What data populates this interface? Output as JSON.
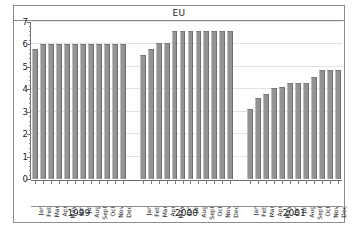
{
  "chart_data": {
    "type": "bar",
    "title": "EU",
    "xlabel": "",
    "ylabel": "",
    "ylim": [
      0,
      7
    ],
    "ytick_labels": [
      "0",
      "1",
      "2",
      "3",
      "4",
      "5",
      "6",
      "7"
    ],
    "ytick_values": [
      0,
      1,
      2,
      3,
      4,
      5,
      6,
      7
    ],
    "grid": true,
    "legend": "none",
    "group_labels": [
      "1999",
      "2000",
      "2001"
    ],
    "categories": [
      "Jan",
      "Feb",
      "Mar",
      "Apr",
      "May",
      "Jun",
      "Jul",
      "Aug",
      "Sept",
      "Oct",
      "Nov",
      "Dec",
      "Jan",
      "Feb",
      "Mar",
      "Apr",
      "May",
      "Jun",
      "Jul",
      "Aug",
      "Sept",
      "Oct",
      "Nov",
      "Dec",
      "Jan",
      "Feb",
      "Mar",
      "Apr",
      "May",
      "Jun",
      "Jul",
      "Aug",
      "Sept",
      "Oct",
      "Nov",
      "Dec"
    ],
    "values": [
      5.8,
      6.0,
      6.0,
      6.0,
      6.0,
      6.0,
      6.0,
      6.0,
      6.0,
      6.0,
      6.0,
      6.0,
      5.55,
      5.8,
      6.05,
      6.05,
      6.6,
      6.6,
      6.6,
      6.6,
      6.6,
      6.6,
      6.6,
      6.6,
      3.1,
      3.6,
      3.8,
      4.05,
      4.1,
      4.3,
      4.3,
      4.3,
      4.55,
      4.85,
      4.85,
      4.85
    ],
    "groups": [
      {
        "year": "1999",
        "months": [
          "Jan",
          "Feb",
          "Mar",
          "Apr",
          "May",
          "Jun",
          "Jul",
          "Aug",
          "Sept",
          "Oct",
          "Nov",
          "Dec"
        ],
        "values": [
          5.8,
          6.0,
          6.0,
          6.0,
          6.0,
          6.0,
          6.0,
          6.0,
          6.0,
          6.0,
          6.0,
          6.0
        ]
      },
      {
        "year": "2000",
        "months": [
          "Jan",
          "Feb",
          "Mar",
          "Apr",
          "May",
          "Jun",
          "Jul",
          "Aug",
          "Sept",
          "Oct",
          "Nov",
          "Dec"
        ],
        "values": [
          5.55,
          5.8,
          6.05,
          6.05,
          6.6,
          6.6,
          6.6,
          6.6,
          6.6,
          6.6,
          6.6,
          6.6
        ]
      },
      {
        "year": "2001",
        "months": [
          "Jan",
          "Feb",
          "Mar",
          "Apr",
          "May",
          "Jun",
          "Jul",
          "Aug",
          "Sept",
          "Oct",
          "Nov",
          "Dec"
        ],
        "values": [
          3.1,
          3.6,
          3.8,
          4.05,
          4.1,
          4.3,
          4.3,
          4.3,
          4.55,
          4.85,
          4.85,
          4.85
        ]
      }
    ],
    "colors": {
      "bar_fill": "#939393",
      "bar_edge": "#6f6f6f",
      "grid": "#e2e2e2",
      "axis": "#6e6e6e",
      "frame": "#8c8c8c",
      "text": "#1a1a1a",
      "background": "#ffffff"
    }
  }
}
